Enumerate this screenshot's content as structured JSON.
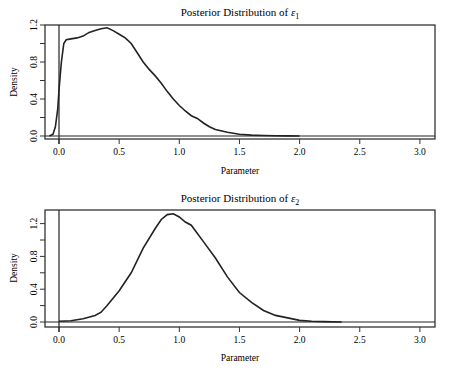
{
  "chart_data": [
    {
      "type": "line",
      "title": "Posterior Distribution of ε1",
      "title_base": "Posterior Distribution of ",
      "title_symbol": "ε",
      "title_sub": "1",
      "xlabel": "Parameter",
      "ylabel": "Density",
      "xlim": [
        -0.1,
        3.1
      ],
      "ylim": [
        0.0,
        1.2
      ],
      "xticks": [
        "0.0",
        "0.5",
        "1.0",
        "1.5",
        "2.0",
        "2.5",
        "3.0"
      ],
      "yticks": [
        "0.0",
        "0.4",
        "0.8",
        "1.2"
      ],
      "grid": false,
      "legend": null,
      "vline_x": 0.0,
      "hline_y": 0.0,
      "series": [
        {
          "name": "density",
          "x": [
            -0.08,
            -0.05,
            -0.03,
            -0.01,
            0.0,
            0.02,
            0.04,
            0.06,
            0.1,
            0.15,
            0.2,
            0.25,
            0.3,
            0.35,
            0.4,
            0.45,
            0.5,
            0.55,
            0.6,
            0.65,
            0.7,
            0.75,
            0.8,
            0.85,
            0.9,
            0.95,
            1.0,
            1.05,
            1.1,
            1.15,
            1.2,
            1.25,
            1.3,
            1.4,
            1.5,
            1.6,
            1.7,
            1.8,
            1.9,
            2.0
          ],
          "values": [
            0.0,
            0.02,
            0.1,
            0.3,
            0.5,
            0.8,
            1.0,
            1.04,
            1.05,
            1.06,
            1.08,
            1.12,
            1.14,
            1.16,
            1.17,
            1.14,
            1.1,
            1.06,
            1.0,
            0.9,
            0.8,
            0.72,
            0.65,
            0.57,
            0.48,
            0.4,
            0.33,
            0.27,
            0.22,
            0.19,
            0.14,
            0.1,
            0.07,
            0.04,
            0.02,
            0.01,
            0.005,
            0.002,
            0.001,
            0.0
          ]
        }
      ]
    },
    {
      "type": "line",
      "title": "Posterior Distribution of ε2",
      "title_base": "Posterior Distribution of ",
      "title_symbol": "ε",
      "title_sub": "2",
      "xlabel": "Parameter",
      "ylabel": "Density",
      "xlim": [
        -0.1,
        3.1
      ],
      "ylim": [
        0.0,
        1.3
      ],
      "xticks": [
        "0.0",
        "0.5",
        "1.0",
        "1.5",
        "2.0",
        "2.5",
        "3.0"
      ],
      "yticks": [
        "0.0",
        "0.4",
        "0.8",
        "1.2"
      ],
      "grid": false,
      "legend": null,
      "vline_x": 0.0,
      "hline_y": 0.0,
      "series": [
        {
          "name": "density",
          "x": [
            0.0,
            0.1,
            0.2,
            0.3,
            0.35,
            0.4,
            0.5,
            0.6,
            0.7,
            0.8,
            0.85,
            0.9,
            0.95,
            1.0,
            1.05,
            1.1,
            1.2,
            1.3,
            1.4,
            1.5,
            1.6,
            1.7,
            1.8,
            1.9,
            2.0,
            2.1,
            2.2,
            2.35
          ],
          "values": [
            0.01,
            0.015,
            0.04,
            0.08,
            0.12,
            0.2,
            0.38,
            0.6,
            0.9,
            1.14,
            1.25,
            1.31,
            1.32,
            1.28,
            1.22,
            1.18,
            0.98,
            0.78,
            0.55,
            0.36,
            0.24,
            0.14,
            0.08,
            0.05,
            0.02,
            0.01,
            0.005,
            0.0
          ]
        }
      ]
    }
  ]
}
